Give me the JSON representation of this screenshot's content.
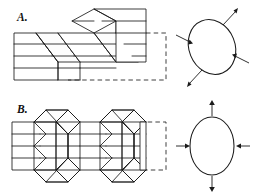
{
  "figure": {
    "background_color": "#ffffff",
    "line_color": "#1a1a1a",
    "ghost_color": "#2a2a2a",
    "panels": [
      {
        "id": "A",
        "label": "A.",
        "block_description": "Layered block offset by two parallel (en-echelon) simple-shear zones; dashed outline shows original undeformed block shape",
        "layer_count": 4,
        "shear_zone_count": 2,
        "shear_sense": "simple shear",
        "ellipse": {
          "name": "strain-ellipse-a",
          "orientation": "inclined",
          "tilt_degrees": -22,
          "rx": 23,
          "ry": 28,
          "extension_arrow_count": 2,
          "extension_direction": "northeast-southwest, outward",
          "compression_arrow_count": 2,
          "compression_direction": "northwest-southeast, inward"
        }
      },
      {
        "id": "B",
        "label": "B.",
        "block_description": "Layered block shortened by two conjugate (chevron) shear zones; dashed outline shows original undeformed block shape",
        "layer_count": 4,
        "shear_zone_count": 2,
        "shear_sense": "pure shear / conjugate",
        "ellipse": {
          "name": "strain-ellipse-b",
          "orientation": "upright",
          "tilt_degrees": 0,
          "rx": 22,
          "ry": 29,
          "extension_arrow_count": 2,
          "extension_direction": "vertical, outward",
          "compression_arrow_count": 2,
          "compression_direction": "horizontal, inward"
        }
      }
    ]
  }
}
